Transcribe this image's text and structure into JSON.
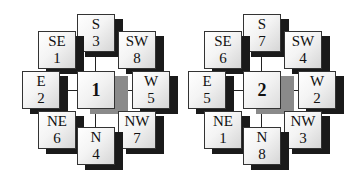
{
  "diagrams": [
    {
      "center": "1",
      "boxes": {
        "S": {
          "dir": "S",
          "num": "3"
        },
        "SE": {
          "dir": "SE",
          "num": "1"
        },
        "SW": {
          "dir": "SW",
          "num": "8"
        },
        "E": {
          "dir": "E",
          "num": "2"
        },
        "W": {
          "dir": "W",
          "num": "5"
        },
        "NE": {
          "dir": "NE",
          "num": "6"
        },
        "NW": {
          "dir": "NW",
          "num": "7"
        },
        "N": {
          "dir": "N",
          "num": "4"
        }
      }
    },
    {
      "center": "2",
      "boxes": {
        "S": {
          "dir": "S",
          "num": "7"
        },
        "SE": {
          "dir": "SE",
          "num": "6"
        },
        "SW": {
          "dir": "SW",
          "num": "4"
        },
        "E": {
          "dir": "E",
          "num": "5"
        },
        "W": {
          "dir": "W",
          "num": "2"
        },
        "NE": {
          "dir": "NE",
          "num": "1"
        },
        "NW": {
          "dir": "NW",
          "num": "3"
        },
        "N": {
          "dir": "N",
          "num": "8"
        }
      }
    }
  ],
  "colors": {
    "box_border": "#333333",
    "shadow": "#1a1a1a",
    "center_shadow": "#8a8a8a",
    "background": "#ffffff"
  }
}
